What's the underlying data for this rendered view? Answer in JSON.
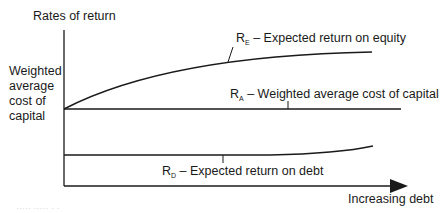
{
  "diagram": {
    "y_axis_label": "Rates of return",
    "x_axis_label": "Increasing debt",
    "side_label_lines": [
      "Weighted",
      "average",
      "cost of",
      "capital"
    ],
    "curves": [
      {
        "id": "RE",
        "symbol": "R",
        "subscript": "E",
        "text": " – Expected return on equity",
        "shape": "concave rising curve"
      },
      {
        "id": "RA",
        "symbol": "R",
        "subscript": "A",
        "text": " – Weighted average cost of capital",
        "shape": "flat horizontal line"
      },
      {
        "id": "RD",
        "symbol": "R",
        "subscript": "D",
        "text": " – Expected return on debt",
        "shape": "flat then slightly rising"
      }
    ],
    "footer_faint": "·····  ·····  ·  ·"
  },
  "colors": {
    "line": "#1a1a1a",
    "background": "#ffffff"
  }
}
